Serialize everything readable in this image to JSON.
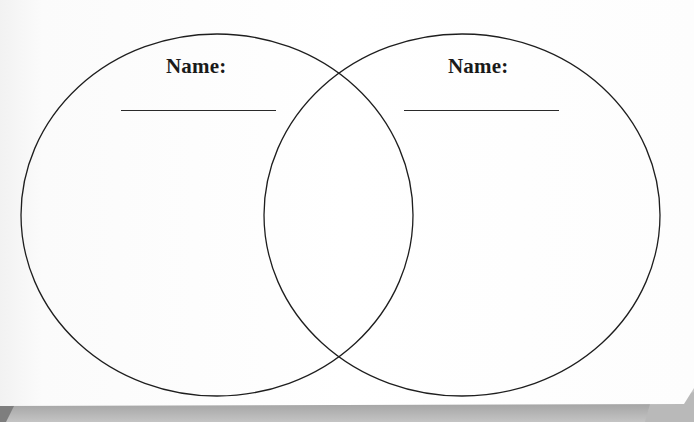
{
  "diagram": {
    "type": "venn",
    "sets": [
      {
        "id": "left",
        "label": "Name:",
        "blank_line": true,
        "circle": {
          "cx": 217,
          "cy": 215,
          "rx": 196,
          "ry": 181
        }
      },
      {
        "id": "right",
        "label": "Name:",
        "blank_line": true,
        "circle": {
          "cx": 462,
          "cy": 215,
          "rx": 198,
          "ry": 181
        }
      }
    ],
    "overlap": "center intersection (blank)",
    "colors": {
      "paper": "#ffffff",
      "stroke": "#1e1e1e",
      "shadow": "#a8a8a8"
    }
  }
}
